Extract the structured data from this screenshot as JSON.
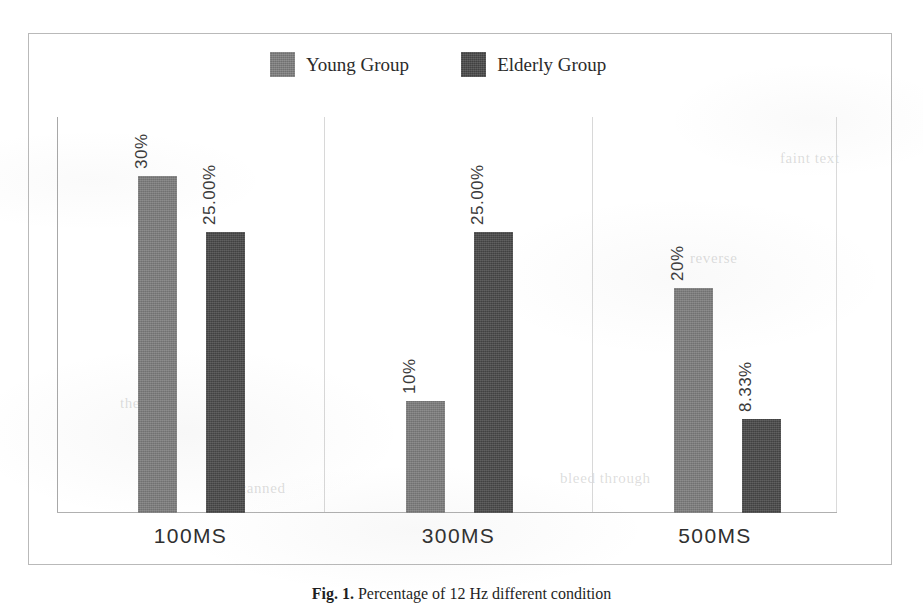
{
  "figure": {
    "caption_label": "Fig. 1.",
    "caption_text": "Percentage of 12 Hz different condition"
  },
  "legend": {
    "entries": [
      {
        "label": "Young Group",
        "swatch": "legend-swatch-young",
        "color": "#7b7b7b"
      },
      {
        "label": "Elderly Group",
        "swatch": "legend-swatch-elderly",
        "color": "#474747"
      }
    ]
  },
  "axis": {
    "categories": [
      "100MS",
      "300MS",
      "500MS"
    ]
  },
  "ghost_text": {
    "g1": "the page",
    "g2": "reverse",
    "g3": "bleed through",
    "g4": "of scanned",
    "g5": "faint text"
  },
  "chart_data": {
    "type": "bar",
    "title": "",
    "xlabel": "",
    "ylabel": "",
    "categories": [
      "100MS",
      "300MS",
      "500MS"
    ],
    "series": [
      {
        "name": "Young Group",
        "color": "#7b7b7b",
        "values": [
          30,
          10,
          20
        ],
        "labels": [
          "30%",
          "10%",
          "20%"
        ]
      },
      {
        "name": "Elderly Group",
        "color": "#474747",
        "values": [
          25.0,
          25.0,
          8.33
        ],
        "labels": [
          "25.00%",
          "25.00%",
          "8.33%"
        ]
      }
    ],
    "ylim": [
      0,
      35.2
    ],
    "grid": false,
    "legend_position": "top-center",
    "value_labels_rotated": true,
    "value_label_rotation_deg": -90,
    "axis_visible": {
      "y_axis": true,
      "x_axis": true,
      "panel_separators": true
    }
  }
}
